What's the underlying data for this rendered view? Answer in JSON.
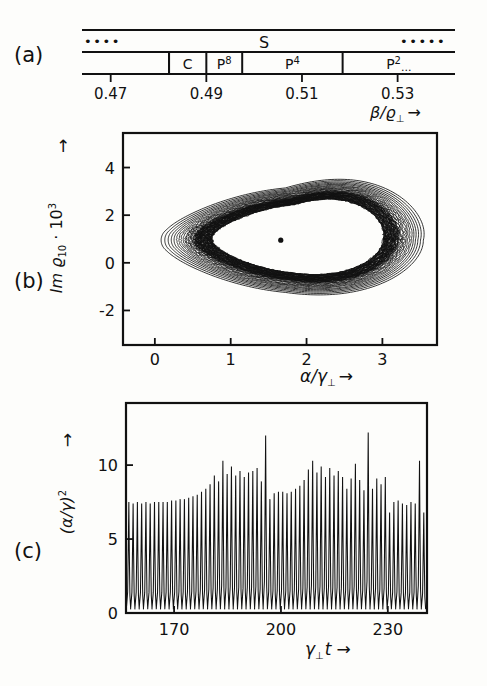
{
  "figure": {
    "panels": [
      "a",
      "b",
      "c"
    ],
    "label_a": "(a)",
    "label_b": "(b)",
    "label_c": "(c)"
  },
  "panel_a": {
    "caption": "(a)",
    "xlabel": "β/ϱ⊥",
    "xlabel_base": "β/ϱ",
    "xlabel_sub": "⊥",
    "arrow": "→",
    "tick_labels": [
      "0.47",
      "0.49",
      "0.51",
      "0.53"
    ],
    "tick_values": [
      0.47,
      0.49,
      0.51,
      0.53
    ],
    "upper_band_label": "S",
    "upper_left_dots": "••••",
    "upper_right_dots": "•••••",
    "segments": [
      {
        "label": "",
        "sup": "",
        "start": 0.464,
        "end": 0.4822
      },
      {
        "label": "C",
        "sup": "",
        "start": 0.4822,
        "end": 0.49
      },
      {
        "label": "P",
        "sup": "8",
        "start": 0.49,
        "end": 0.4975
      },
      {
        "label": "P",
        "sup": "4",
        "start": 0.4975,
        "end": 0.5185
      },
      {
        "label": "P",
        "sup": "2",
        "suffix": "...",
        "start": 0.5185,
        "end": 0.542
      }
    ],
    "axis_min": 0.464,
    "axis_max": 0.542
  },
  "panel_b": {
    "caption": "(b)",
    "xlabel_base": "α/γ",
    "xlabel_sub": "⊥",
    "xlabel_arrow": "→",
    "ylabel_pre": "Im ϱ",
    "ylabel_sub": "10",
    "ylabel_mid": " · 10",
    "ylabel_sup": "3",
    "ylabel_arrow": "↑",
    "xticks": [
      0,
      1,
      2,
      3
    ],
    "xtick_labels": [
      "0",
      "1",
      "2",
      "3"
    ],
    "yticks": [
      -2,
      0,
      2,
      4
    ],
    "ytick_labels": [
      "-2",
      "0",
      "2",
      "4"
    ],
    "xlim": [
      -0.42,
      3.72
    ],
    "ylim": [
      -3.45,
      5.45
    ],
    "fixed_point": {
      "x": 1.66,
      "y": 0.95
    },
    "type": "phase-portrait"
  },
  "panel_c": {
    "caption": "(c)",
    "xlabel_base": "γ",
    "xlabel_sub": "⊥",
    "xlabel_var": "t",
    "xlabel_arrow": "→",
    "ylabel_base": "(α/γ)",
    "ylabel_sup": "2",
    "ylabel_arrow": "→",
    "xticks": [
      170,
      200,
      230
    ],
    "xtick_labels": [
      "170",
      "200",
      "230"
    ],
    "yticks": [
      0,
      5,
      10
    ],
    "ytick_labels": [
      "0",
      "5",
      "10"
    ],
    "xlim": [
      156.5,
      241.0
    ],
    "ylim": [
      0,
      14.2
    ],
    "type": "line"
  },
  "chart_data": [
    {
      "type": "bar",
      "panel": "a",
      "title": "Bifurcation / parameter-regime bar diagram",
      "xlabel": "β/ϱ⊥",
      "ylabel": "",
      "xlim": [
        0.464,
        0.542
      ],
      "tick_labels": [
        "0.47",
        "0.49",
        "0.51",
        "0.53"
      ],
      "tick_values": [
        0.47,
        0.49,
        0.51,
        0.53
      ],
      "categories": [
        "C",
        "P8",
        "P4",
        "P2..."
      ],
      "regimes": [
        {
          "name": "chaos-left",
          "label": "",
          "from": 0.464,
          "to": 0.4822
        },
        {
          "name": "C",
          "label": "C",
          "from": 0.4822,
          "to": 0.49
        },
        {
          "name": "P8",
          "label": "P8",
          "from": 0.49,
          "to": 0.4975
        },
        {
          "name": "P4",
          "label": "P4",
          "from": 0.4975,
          "to": 0.5185
        },
        {
          "name": "P2",
          "label": "P2...",
          "from": 0.5185,
          "to": 0.542
        }
      ],
      "upper_band": {
        "label": "S",
        "from": 0.464,
        "to": 0.542
      }
    },
    {
      "type": "line",
      "panel": "b",
      "title": "Chaotic attractor in the (α/γ⊥, Im ϱ₁₀·10³) plane",
      "xlabel": "α/γ⊥",
      "ylabel": "Im ϱ₁₀ · 10³",
      "xlim": [
        -0.42,
        3.72
      ],
      "ylim": [
        -3.45,
        5.45
      ],
      "xticks": [
        0,
        1,
        2,
        3
      ],
      "yticks": [
        -2,
        0,
        2,
        4
      ],
      "grid": false,
      "legend": false,
      "annotations": [
        {
          "kind": "point",
          "x": 1.66,
          "y": 0.95,
          "label": "unstable fixed point"
        }
      ],
      "orbit_loops": 17,
      "loop_scales": [
        1.0,
        0.975,
        0.952,
        0.931,
        0.912,
        0.894,
        0.878,
        0.863,
        0.849,
        0.836,
        0.824,
        0.813,
        0.803,
        0.794,
        0.786,
        0.779,
        0.773
      ],
      "outer_loop_extent": {
        "x_min": 0.02,
        "x_max": 3.52,
        "y_min": -2.95,
        "y_max": 4.95
      }
    },
    {
      "type": "line",
      "panel": "c",
      "title": "Spiking time series of the field intensity",
      "xlabel": "γ⊥t",
      "ylabel": "(α/γ)²",
      "xlim": [
        156.5,
        241.0
      ],
      "ylim": [
        0,
        14.2
      ],
      "xticks": [
        170,
        200,
        230
      ],
      "yticks": [
        0,
        5,
        10
      ],
      "grid": false,
      "legend": false,
      "baseline": 0.25,
      "peak_times": [
        157.3,
        158.5,
        159.7,
        160.9,
        162.1,
        163.3,
        164.5,
        165.7,
        166.9,
        168.1,
        169.3,
        170.5,
        171.7,
        172.9,
        174.1,
        175.3,
        176.5,
        177.7,
        178.9,
        180.1,
        181.3,
        182.5,
        183.7,
        184.9,
        186.1,
        187.3,
        188.5,
        189.7,
        190.9,
        192.1,
        193.3,
        194.5,
        195.7,
        196.9,
        198.1,
        199.3,
        200.5,
        201.7,
        202.9,
        204.1,
        205.3,
        206.5,
        207.7,
        208.9,
        210.1,
        211.3,
        212.5,
        213.7,
        214.9,
        216.1,
        217.3,
        218.5,
        219.7,
        220.9,
        222.1,
        223.3,
        224.5,
        225.7,
        226.9,
        228.1,
        229.3,
        230.5,
        231.7,
        232.9,
        234.1,
        235.3,
        236.5,
        237.7,
        238.9,
        240.1
      ],
      "peak_values": [
        7.5,
        7.4,
        7.5,
        7.4,
        7.5,
        7.4,
        7.5,
        7.5,
        7.5,
        7.5,
        7.6,
        7.6,
        7.7,
        7.7,
        7.8,
        7.9,
        8.0,
        8.2,
        8.4,
        8.7,
        9.3,
        8.9,
        10.3,
        9.4,
        9.9,
        9.3,
        9.6,
        9.2,
        9.5,
        9.6,
        9.8,
        8.9,
        12.0,
        7.7,
        8.1,
        8.2,
        8.2,
        8.1,
        8.2,
        8.4,
        8.6,
        9.0,
        9.7,
        10.3,
        9.5,
        9.9,
        9.2,
        9.8,
        9.3,
        9.6,
        9.2,
        8.4,
        9.1,
        10.1,
        9.0,
        8.3,
        12.2,
        8.4,
        9.1,
        8.7,
        9.2,
        6.8,
        7.5,
        7.6,
        7.4,
        7.3,
        7.5,
        7.4,
        10.3,
        6.8
      ],
      "tall_spikes": [
        {
          "t": 183.7,
          "v": 12.0
        },
        {
          "t": 229.3,
          "v": 12.2
        }
      ],
      "n_peaks": 70
    }
  ]
}
